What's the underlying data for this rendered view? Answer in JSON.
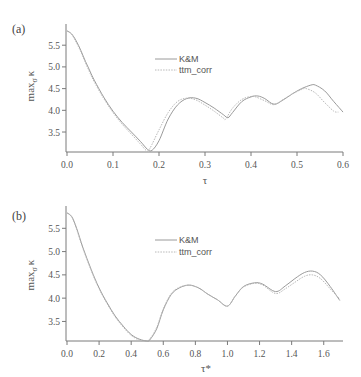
{
  "chart_data": [
    {
      "type": "line",
      "panel_label": "(a)",
      "title": "",
      "xlabel": "τ",
      "ylabel": "max_σ κ",
      "ylabel_main": "max",
      "ylabel_sub": "σ",
      "ylabel_symbol": "κ",
      "xlim": [
        0.0,
        0.6
      ],
      "ylim": [
        3.04,
        5.85
      ],
      "xticks": [
        "0.0",
        "0.1",
        "0.2",
        "0.3",
        "0.4",
        "0.5",
        "0.6"
      ],
      "yticks": [
        "3.5",
        "4.0",
        "4.5",
        "5.0",
        "5.5"
      ],
      "grid": false,
      "legend_position": "upper-center",
      "series": [
        {
          "name": "K&M",
          "style": "solid",
          "x": [
            0.0,
            0.01,
            0.02,
            0.03,
            0.04,
            0.05,
            0.06,
            0.08,
            0.1,
            0.12,
            0.14,
            0.16,
            0.175,
            0.185,
            0.2,
            0.22,
            0.24,
            0.26,
            0.28,
            0.3,
            0.32,
            0.34,
            0.35,
            0.36,
            0.38,
            0.4,
            0.415,
            0.43,
            0.45,
            0.47,
            0.49,
            0.51,
            0.53,
            0.54,
            0.56,
            0.58,
            0.6
          ],
          "y": [
            5.83,
            5.76,
            5.6,
            5.38,
            5.13,
            4.9,
            4.68,
            4.3,
            3.98,
            3.72,
            3.5,
            3.28,
            3.1,
            3.08,
            3.3,
            3.8,
            4.12,
            4.27,
            4.28,
            4.18,
            4.05,
            3.9,
            3.83,
            3.95,
            4.2,
            4.31,
            4.33,
            4.27,
            4.14,
            4.24,
            4.38,
            4.5,
            4.58,
            4.58,
            4.45,
            4.2,
            3.96
          ]
        },
        {
          "name": "ttm_corr",
          "style": "dotted",
          "x": [
            0.0,
            0.01,
            0.02,
            0.03,
            0.04,
            0.05,
            0.06,
            0.08,
            0.1,
            0.12,
            0.14,
            0.16,
            0.172,
            0.18,
            0.2,
            0.22,
            0.24,
            0.26,
            0.28,
            0.3,
            0.32,
            0.34,
            0.345,
            0.36,
            0.38,
            0.4,
            0.41,
            0.43,
            0.45,
            0.47,
            0.49,
            0.51,
            0.52,
            0.54,
            0.56,
            0.58,
            0.59
          ],
          "y": [
            5.83,
            5.75,
            5.57,
            5.35,
            5.1,
            4.86,
            4.64,
            4.27,
            3.95,
            3.68,
            3.45,
            3.22,
            3.08,
            3.12,
            3.55,
            3.95,
            4.2,
            4.28,
            4.24,
            4.12,
            3.98,
            3.82,
            3.8,
            4.05,
            4.25,
            4.32,
            4.31,
            4.22,
            4.13,
            4.25,
            4.38,
            4.48,
            4.5,
            4.4,
            4.18,
            3.98,
            3.96
          ]
        }
      ]
    },
    {
      "type": "line",
      "panel_label": "(b)",
      "title": "",
      "xlabel": "τ*",
      "ylabel": "max_σ κ",
      "ylabel_main": "max",
      "ylabel_sub": "σ",
      "ylabel_symbol": "κ",
      "xlim": [
        0.0,
        1.72
      ],
      "ylim": [
        3.08,
        5.85
      ],
      "xticks": [
        "0.0",
        "0.2",
        "0.4",
        "0.6",
        "0.8",
        "1.0",
        "1.2",
        "1.4",
        "1.6"
      ],
      "yticks": [
        "3.5",
        "4.0",
        "4.5",
        "5.0",
        "5.5"
      ],
      "grid": false,
      "legend_position": "upper-center",
      "series": [
        {
          "name": "K&M",
          "style": "solid",
          "x": [
            0.0,
            0.03,
            0.06,
            0.1,
            0.15,
            0.2,
            0.25,
            0.3,
            0.35,
            0.4,
            0.45,
            0.5,
            0.52,
            0.56,
            0.6,
            0.65,
            0.7,
            0.76,
            0.82,
            0.88,
            0.94,
            1.0,
            1.05,
            1.1,
            1.17,
            1.22,
            1.3,
            1.36,
            1.42,
            1.48,
            1.53,
            1.58,
            1.64,
            1.7
          ],
          "y": [
            5.83,
            5.75,
            5.5,
            5.08,
            4.62,
            4.22,
            3.9,
            3.62,
            3.4,
            3.22,
            3.12,
            3.08,
            3.12,
            3.35,
            3.75,
            4.08,
            4.22,
            4.28,
            4.22,
            4.08,
            3.96,
            3.83,
            4.05,
            4.25,
            4.33,
            4.3,
            4.14,
            4.26,
            4.42,
            4.55,
            4.58,
            4.5,
            4.25,
            3.95
          ]
        },
        {
          "name": "ttm_corr",
          "style": "dotted",
          "x": [
            0.0,
            0.03,
            0.06,
            0.1,
            0.15,
            0.2,
            0.25,
            0.3,
            0.35,
            0.4,
            0.45,
            0.49,
            0.52,
            0.56,
            0.6,
            0.65,
            0.7,
            0.76,
            0.82,
            0.88,
            0.94,
            1.0,
            1.05,
            1.1,
            1.17,
            1.22,
            1.3,
            1.36,
            1.42,
            1.48,
            1.53,
            1.58,
            1.64,
            1.7
          ],
          "y": [
            5.83,
            5.74,
            5.48,
            5.06,
            4.6,
            4.2,
            3.88,
            3.6,
            3.38,
            3.2,
            3.1,
            3.08,
            3.14,
            3.38,
            3.77,
            4.1,
            4.23,
            4.28,
            4.22,
            4.08,
            3.96,
            3.83,
            4.05,
            4.24,
            4.32,
            4.28,
            4.1,
            4.2,
            4.34,
            4.47,
            4.5,
            4.42,
            4.2,
            3.98
          ]
        }
      ]
    }
  ]
}
